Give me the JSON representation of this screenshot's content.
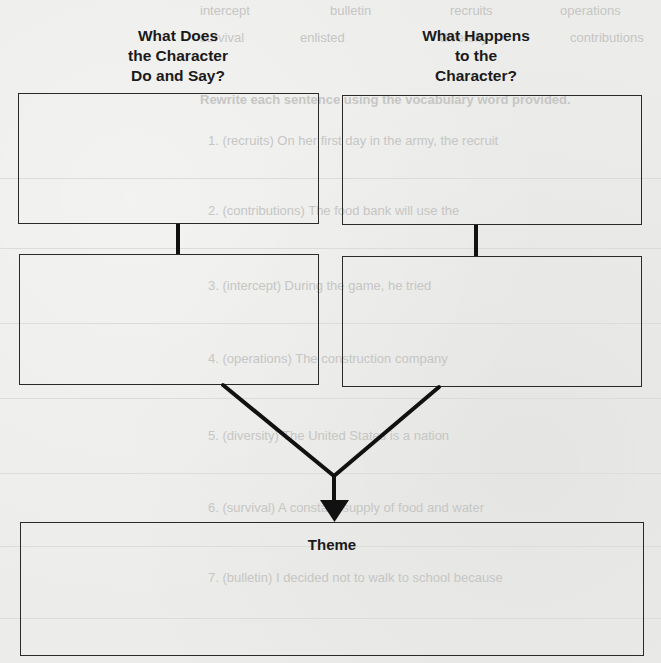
{
  "diagram": {
    "left_column_title": [
      "What Does",
      "the Character",
      "Do and Say?"
    ],
    "right_column_title": [
      "What Happens",
      "to the",
      "Character?"
    ],
    "boxes": {
      "left_top": "",
      "left_bottom": "",
      "right_top": "",
      "right_bottom": "",
      "theme_label": "Theme",
      "theme_content": ""
    }
  },
  "bleed_through": {
    "word_bank_row1": [
      "operations",
      "recruits",
      "bulletin",
      "intercept"
    ],
    "word_bank_row2": [
      "contributions",
      "diversity",
      "enlisted",
      "survival"
    ],
    "instructions": "Rewrite each sentence using the vocabulary word provided.",
    "items": [
      "1. (recruits) On her first day in the army, the recruit",
      "2. (contributions) The food bank will use the",
      "3. (intercept) During the game, he tried",
      "4. (operations) The construction company",
      "5. (diversity) The United States is a nation",
      "6. (survival) A constant supply of food and water",
      "7. (bulletin) I decided not to walk to school because"
    ]
  },
  "colors": {
    "paper": "#ececea",
    "ink": "#1a1a1a",
    "box_border": "#2a2a2a",
    "bleed_text": "#c6c6c4"
  }
}
